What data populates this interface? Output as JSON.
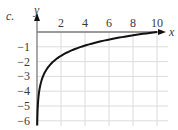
{
  "problem_label": "c.",
  "chart_data": {
    "type": "line",
    "title": "",
    "xlabel": "x",
    "ylabel": "y",
    "xlim": [
      0,
      10.5
    ],
    "ylim": [
      -6.3,
      0
    ],
    "grid": true,
    "x_ticks": [
      "2",
      "4",
      "6",
      "8",
      "10"
    ],
    "y_ticks": [
      "-1",
      "-2",
      "-3",
      "-4",
      "-5",
      "-6"
    ],
    "series": [
      {
        "name": "curve",
        "function": "y = ln(x/10)",
        "x": [
          0.025,
          0.1,
          0.33,
          0.5,
          1,
          2,
          3,
          4,
          5,
          6,
          7,
          8,
          9,
          10
        ],
        "y": [
          -6.0,
          -4.6,
          -3.4,
          -3.0,
          -2.3,
          -1.6,
          -1.2,
          -0.9,
          -0.7,
          -0.5,
          -0.36,
          -0.22,
          -0.1,
          0
        ]
      }
    ],
    "colors": {
      "curve": "#111111",
      "grid": "#dcdcdc",
      "axis": "#7a7a7a"
    }
  }
}
